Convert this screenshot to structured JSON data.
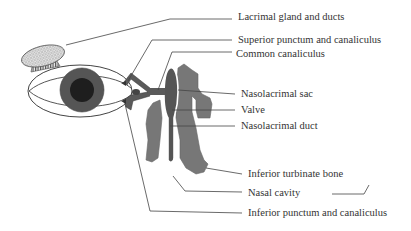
{
  "diagram": {
    "labels": [
      {
        "id": "lacrimal-gland",
        "text": "Lacrimal gland and ducts",
        "x": 238,
        "y": 14
      },
      {
        "id": "superior-punctum",
        "text": "Superior punctum and canaliculus",
        "x": 238,
        "y": 31
      },
      {
        "id": "common-canaliculus",
        "text": "Common canaliculus",
        "x": 236,
        "y": 47
      },
      {
        "id": "nasolacrimal-sac",
        "text": "Nasolacrimal sac",
        "x": 241,
        "y": 89
      },
      {
        "id": "valve",
        "text": "Valve",
        "x": 241,
        "y": 105
      },
      {
        "id": "nasolacrimal-duct",
        "text": "Nasolacrimal duct",
        "x": 241,
        "y": 121
      },
      {
        "id": "inferior-turbinate",
        "text": "Inferior turbinate bone",
        "x": 248,
        "y": 167
      },
      {
        "id": "nasal-cavity",
        "text": "Nasal cavity",
        "x": 248,
        "y": 186
      },
      {
        "id": "inferior-punctum",
        "text": "Inferior punctum and canaliculus",
        "x": 248,
        "y": 206
      }
    ],
    "colors": {
      "line": "#444444",
      "iris": "#555555",
      "pupil": "#1e1e1e",
      "sac": "#555555",
      "tissue": "#7a7a7a",
      "canaliculus": "#5a5a5a",
      "gland": "#cfcfcf"
    }
  }
}
